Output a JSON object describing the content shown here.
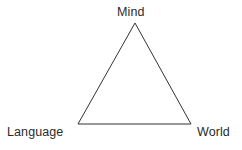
{
  "figure": {
    "type": "triangle-diagram",
    "background_color": "#ffffff",
    "stroke_color": "#333333",
    "stroke_width": 1,
    "text_color": "#2b2b2b",
    "width": 242,
    "height": 150,
    "vertices": [
      {
        "id": "mind",
        "label": "Mind",
        "x": 135,
        "y": 23,
        "label_position": "top"
      },
      {
        "id": "language",
        "label": "Language",
        "x": 78,
        "y": 124,
        "label_position": "bottom-left"
      },
      {
        "id": "world",
        "label": "World",
        "x": 191,
        "y": 124,
        "label_position": "bottom-right"
      }
    ],
    "edges": [
      {
        "from": "mind",
        "to": "language"
      },
      {
        "from": "language",
        "to": "world"
      },
      {
        "from": "world",
        "to": "mind"
      }
    ],
    "points_attr": "135,23 78,124 191,124"
  }
}
